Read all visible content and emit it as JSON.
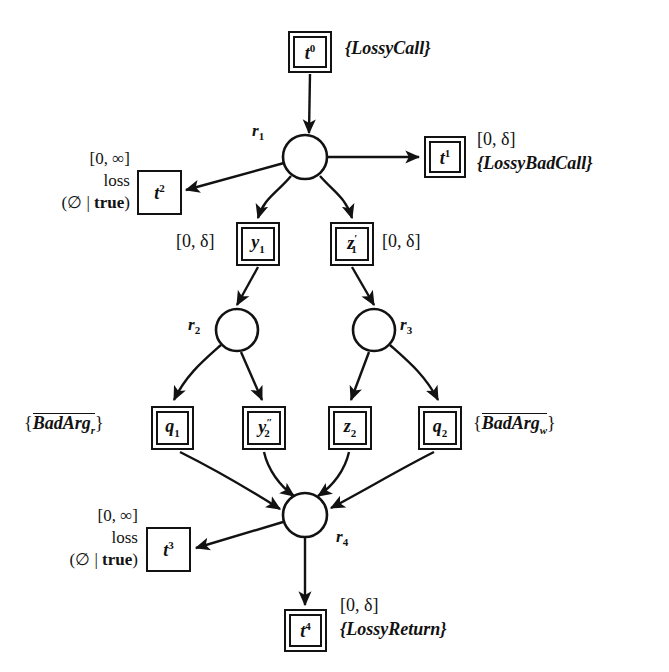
{
  "diagram": {
    "stroke_color": "#121212",
    "background": "#ffffff"
  },
  "places": [
    {
      "id": "r1",
      "label": "r",
      "sub": "1",
      "cx": 305,
      "cy": 157,
      "r": 22
    },
    {
      "id": "r2",
      "label": "r",
      "sub": "2",
      "cx": 237,
      "cy": 330,
      "r": 21
    },
    {
      "id": "r3",
      "label": "r",
      "sub": "3",
      "cx": 374,
      "cy": 330,
      "r": 21
    },
    {
      "id": "r4",
      "label": "r",
      "sub": "4",
      "cx": 305,
      "cy": 515,
      "r": 22
    }
  ],
  "transitions": [
    {
      "id": "t0",
      "base": "t",
      "sup": "0",
      "sub": "",
      "prime": "",
      "border": "double",
      "x": 288,
      "y": 31,
      "w": 44,
      "h": 42
    },
    {
      "id": "t1",
      "base": "t",
      "sup": "1",
      "sub": "",
      "prime": "",
      "border": "double",
      "x": 424,
      "y": 136,
      "w": 42,
      "h": 42
    },
    {
      "id": "t2",
      "base": "t",
      "sup": "2",
      "sub": "",
      "prime": "",
      "border": "single",
      "x": 137,
      "y": 170,
      "w": 45,
      "h": 45
    },
    {
      "id": "y1",
      "base": "y",
      "sup": "",
      "sub": "1",
      "prime": "",
      "border": "double",
      "x": 236,
      "y": 222,
      "w": 44,
      "h": 44
    },
    {
      "id": "z1p",
      "base": "z",
      "sup": "",
      "sub": "1",
      "prime": "'",
      "border": "double",
      "x": 330,
      "y": 222,
      "w": 44,
      "h": 44
    },
    {
      "id": "q1",
      "base": "q",
      "sup": "",
      "sub": "1",
      "prime": "",
      "border": "double",
      "x": 151,
      "y": 406,
      "w": 43,
      "h": 44
    },
    {
      "id": "y2pp",
      "base": "y",
      "sup": "",
      "sub": "2",
      "prime": "\"",
      "border": "double",
      "x": 242,
      "y": 406,
      "w": 44,
      "h": 44
    },
    {
      "id": "z2",
      "base": "z",
      "sup": "",
      "sub": "2",
      "prime": "",
      "border": "double",
      "x": 328,
      "y": 406,
      "w": 44,
      "h": 44
    },
    {
      "id": "q2",
      "base": "q",
      "sup": "",
      "sub": "2",
      "prime": "",
      "border": "double",
      "x": 418,
      "y": 406,
      "w": 44,
      "h": 44
    },
    {
      "id": "t3",
      "base": "t",
      "sup": "3",
      "sub": "",
      "prime": "",
      "border": "single",
      "x": 146,
      "y": 527,
      "w": 45,
      "h": 45
    },
    {
      "id": "t4",
      "base": "t",
      "sup": "4",
      "sub": "",
      "prime": "",
      "border": "double",
      "x": 284,
      "y": 609,
      "w": 43,
      "h": 43
    }
  ],
  "annotations": {
    "t0_set": "{LossyCall}",
    "t1_interval": "[0, δ]",
    "t1_set": "{LossyBadCall}",
    "t2_interval": "[0, ∞]",
    "t2_loss": "loss",
    "t2_guard_open": "(∅ | ",
    "t2_guard_true": "true",
    "t2_guard_close": ")",
    "y1_interval": "[0, δ]",
    "z1p_interval": "[0, δ]",
    "q1_set_open": "{",
    "q1_set_body": "BadArg",
    "q1_set_sub": "r",
    "q1_set_close": "}",
    "q2_set_open": "{",
    "q2_set_body": "BadArg",
    "q2_set_sub": "w",
    "q2_set_close": "}",
    "t3_interval": "[0, ∞]",
    "t3_loss": "loss",
    "t3_guard_open": "(∅ | ",
    "t3_guard_true": "true",
    "t3_guard_close": ")",
    "t4_interval": "[0, δ]",
    "t4_set": "{LossyReturn}"
  },
  "place_labels": {
    "r1": "r",
    "r1_sub": "1",
    "r2": "r",
    "r2_sub": "2",
    "r3": "r",
    "r3_sub": "3",
    "r4": "r",
    "r4_sub": "4"
  },
  "box_glyphs": {
    "t0": "t",
    "t0_sup": "0",
    "t1": "t",
    "t1_sup": "1",
    "t2": "t",
    "t2_sup": "2",
    "t3": "t",
    "t3_sup": "3",
    "t4": "t",
    "t4_sup": "4",
    "y1": "y",
    "y1_sub": "1",
    "z1p": "z",
    "z1p_sub": "1",
    "z1p_prime": "′",
    "q1": "q",
    "q1_sub": "1",
    "y2pp": "y",
    "y2pp_sub": "2",
    "y2pp_prime": "″",
    "z2": "z",
    "z2_sub": "2",
    "q2": "q",
    "q2_sub": "2"
  }
}
